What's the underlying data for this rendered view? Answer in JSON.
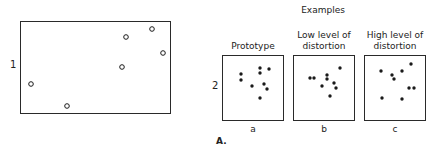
{
  "figure": {
    "panel_label": "A.",
    "panel1": {
      "label": "1",
      "box": {
        "x": 20,
        "y": 21,
        "w": 150,
        "h": 92
      },
      "marker": "open-circle",
      "points": [
        [
          31,
          84
        ],
        [
          67,
          106
        ],
        [
          122,
          67
        ],
        [
          126,
          37
        ],
        [
          152,
          29
        ],
        [
          163,
          53
        ]
      ]
    },
    "panel2": {
      "label": "2",
      "heading": "Examples",
      "subpanels": [
        {
          "title_line1": "",
          "title_line2": "Prototype",
          "caption": "a",
          "box": {
            "x": 222,
            "y": 55,
            "w": 61,
            "h": 65
          },
          "marker": "filled-dot",
          "points": [
            [
              241,
              74
            ],
            [
              241,
              80
            ],
            [
              260,
              68
            ],
            [
              260,
              73
            ],
            [
              269,
              69
            ],
            [
              252,
              86
            ],
            [
              264,
              84
            ],
            [
              267,
              89
            ],
            [
              260,
              98
            ]
          ]
        },
        {
          "title_line1": "Low level of",
          "title_line2": "distortion",
          "caption": "b",
          "box": {
            "x": 293,
            "y": 55,
            "w": 61,
            "h": 65
          },
          "marker": "filled-dot",
          "points": [
            [
              310,
              78
            ],
            [
              314,
              78
            ],
            [
              327,
              75
            ],
            [
              327,
              79
            ],
            [
              340,
              68
            ],
            [
              322,
              86
            ],
            [
              334,
              83
            ],
            [
              336,
              88
            ],
            [
              330,
              96
            ]
          ]
        },
        {
          "title_line1": "High level of",
          "title_line2": "distortion",
          "caption": "c",
          "box": {
            "x": 364,
            "y": 55,
            "w": 61,
            "h": 65
          },
          "marker": "filled-dot",
          "points": [
            [
              381,
              71
            ],
            [
              392,
              75
            ],
            [
              394,
              79
            ],
            [
              402,
              71
            ],
            [
              411,
              64
            ],
            [
              409,
              88
            ],
            [
              414,
              88
            ],
            [
              382,
              98
            ],
            [
              402,
              99
            ]
          ]
        }
      ]
    },
    "colors": {
      "ink": "#1a1a1a",
      "background": "#ffffff"
    }
  }
}
